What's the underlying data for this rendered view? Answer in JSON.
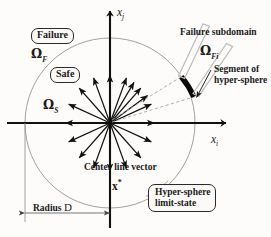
{
  "figure": {
    "geometry": {
      "origin_x": 110,
      "origin_y": 123,
      "radius_px": 85,
      "arc_start_deg": 33,
      "arc_end_deg": 62,
      "n_center_line_vectors": 18
    },
    "colors": {
      "axis": "#111111",
      "circle": "#8e8e8e",
      "arc_highlight": "#000000",
      "bracket": "#b9b9b9",
      "dashed": "#a8a8a8",
      "dimension": "#6f6f6f",
      "text": "#1a1a1a",
      "background": "#fdfcfa"
    },
    "axes": {
      "vertical_label": "x",
      "vertical_subscript": "j",
      "horizontal_label": "x",
      "horizontal_subscript": "i"
    },
    "labels": {
      "failure_box": "Failure",
      "safe_box": "Safe",
      "omega_failure": "Ω",
      "omega_failure_sub": "F",
      "omega_safe": "Ω",
      "omega_safe_sub": "S",
      "omega_subdomain": "Ω",
      "omega_subdomain_sub": "Fi",
      "failure_subdomain": "Failure subdomain",
      "segment_line1": "Segment of",
      "segment_line2": "hyper-sphere",
      "center_line_vector": "Center line vector",
      "x_star": "x",
      "x_star_sup": "*",
      "hypersphere_line1": "Hyper-sphere",
      "hypersphere_line2": "limit-state",
      "radius_prefix": "Radius",
      "radius_symbol": "D"
    }
  }
}
